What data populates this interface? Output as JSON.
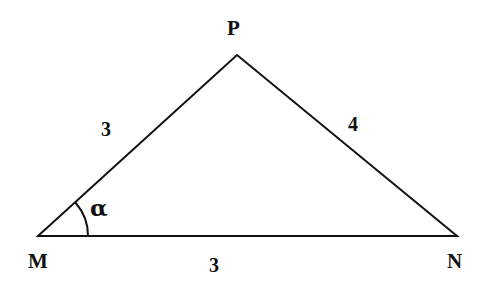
{
  "figure": {
    "type": "geometry-diagram",
    "shape": "triangle",
    "background_color": "#ffffff",
    "stroke_color": "#111111",
    "stroke_width": 2
  },
  "vertices": [
    {
      "id": "M",
      "label": "M",
      "x": 38,
      "y": 236,
      "label_x": 28,
      "label_y": 251
    },
    {
      "id": "N",
      "label": "N",
      "x": 457,
      "y": 236,
      "label_x": 447,
      "label_y": 251
    },
    {
      "id": "P",
      "label": "P",
      "x": 237,
      "y": 55,
      "label_x": 227,
      "label_y": 18
    }
  ],
  "sides": [
    {
      "id": "MP",
      "from": "M",
      "to": "P",
      "length_label": "3",
      "label_x": 101,
      "label_y": 119
    },
    {
      "id": "PN",
      "from": "P",
      "to": "N",
      "length_label": "4",
      "label_x": 348,
      "label_y": 114
    },
    {
      "id": "MN",
      "from": "M",
      "to": "N",
      "length_label": "3",
      "label_x": 209,
      "label_y": 255
    }
  ],
  "angles": [
    {
      "id": "alpha-at-M",
      "at_vertex": "M",
      "label": "α",
      "label_x": 90,
      "label_y": 196,
      "arc_radius": 50,
      "arc_from_deg": 0,
      "arc_to_deg": 42
    }
  ],
  "paths": {
    "triangle_outline": "M 38 236 L 237 55 L 457 236 Z",
    "angle_arc": "M 88 236 A 50 50 0 0 0 75.8 203"
  }
}
